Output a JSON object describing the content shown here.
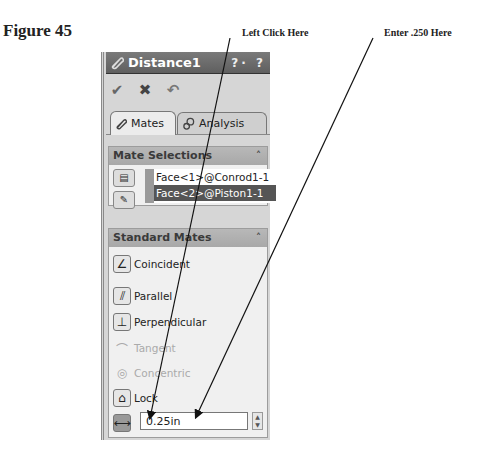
{
  "figure_label": "Figure 45",
  "callouts": {
    "left_click": "Left Click Here",
    "enter_value": "Enter .250 Here"
  },
  "property_manager": {
    "title": "Distance1",
    "help_icons": "?· ?",
    "toolbar": {
      "ok_icon": "✔",
      "cancel_icon": "✖",
      "undo_icon": "↶"
    },
    "tabs": [
      {
        "label": "Mates",
        "icon": "paperclip-icon",
        "active": true
      },
      {
        "label": "Analysis",
        "icon": "gears-icon",
        "active": false
      }
    ],
    "mate_selections": {
      "header": "Mate Selections",
      "collapse_glyph": "˄",
      "items": [
        "Face<1>@Conrod1-1",
        "Face<2>@Piston1-1"
      ],
      "selected_index": 1
    },
    "standard_mates": {
      "header": "Standard Mates",
      "collapse_glyph": "˄",
      "items": [
        {
          "label": "Coincident",
          "glyph": "∠",
          "enabled": true
        },
        {
          "label": "Parallel",
          "glyph": "⫽",
          "enabled": true
        },
        {
          "label": "Perpendicular",
          "glyph": "⊥",
          "enabled": true
        },
        {
          "label": "Tangent",
          "glyph": "⌒",
          "enabled": false
        },
        {
          "label": "Concentric",
          "glyph": "◎",
          "enabled": false
        },
        {
          "label": "Lock",
          "glyph": "⌂",
          "enabled": true
        }
      ],
      "distance": {
        "glyph": "⟷",
        "value": "0.25in",
        "spinner_up": "▲",
        "spinner_down": "▼"
      }
    }
  }
}
